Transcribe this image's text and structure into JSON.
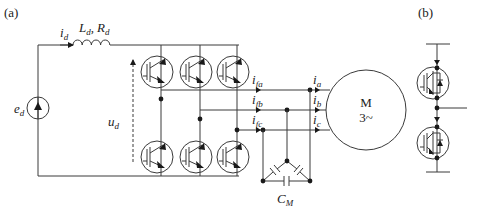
{
  "panels": [
    {
      "id": "a",
      "label": "(a)"
    },
    {
      "id": "b",
      "label": "(b)"
    }
  ],
  "source": {
    "symbol": "e",
    "subscript": "d"
  },
  "dc_current": {
    "symbol": "i",
    "subscript": "d"
  },
  "dc_impedance": {
    "L": "L",
    "L_sub": "d",
    "sep": ",",
    "R": "R",
    "R_sub": "d"
  },
  "dc_voltage": {
    "symbol": "u",
    "subscript": "d"
  },
  "filter_currents": [
    {
      "symbol": "i",
      "subscript": "fa"
    },
    {
      "symbol": "i",
      "subscript": "fb"
    },
    {
      "symbol": "i",
      "subscript": "fc"
    }
  ],
  "phase_currents": [
    {
      "symbol": "i",
      "subscript": "a"
    },
    {
      "symbol": "i",
      "subscript": "b"
    },
    {
      "symbol": "i",
      "subscript": "c"
    }
  ],
  "motor": {
    "line1": "M",
    "line2": "3~"
  },
  "capacitor": {
    "symbol": "C",
    "subscript": "M"
  },
  "colors": {
    "line": "#3a3a3a",
    "text": "#222222",
    "background": "#ffffff"
  }
}
